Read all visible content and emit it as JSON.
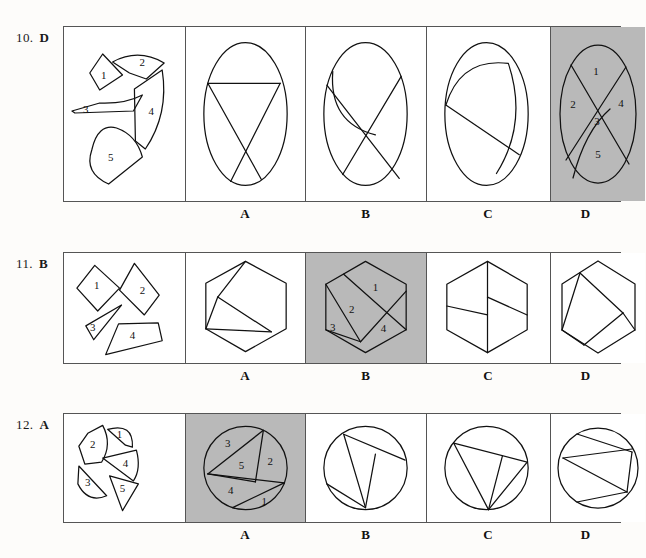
{
  "page": {
    "background": "#fdfcfa",
    "shaded_color": "#b9b9b9",
    "stroke_color": "#111111"
  },
  "rows": [
    {
      "id": "row-10",
      "number": "10.",
      "answer": "D",
      "pieces_panel": {
        "name": "pieces-panel-10",
        "piece_labels": [
          "1",
          "2",
          "3",
          "4",
          "5"
        ]
      },
      "options": [
        {
          "letter": "A",
          "shaded": false
        },
        {
          "letter": "B",
          "shaded": false
        },
        {
          "letter": "C",
          "shaded": false
        },
        {
          "letter": "D",
          "shaded": true,
          "piece_labels": [
            "1",
            "2",
            "3",
            "4",
            "5"
          ]
        }
      ]
    },
    {
      "id": "row-11",
      "number": "11.",
      "answer": "B",
      "pieces_panel": {
        "name": "pieces-panel-11",
        "piece_labels": [
          "1",
          "2",
          "3",
          "4"
        ]
      },
      "options": [
        {
          "letter": "A",
          "shaded": false
        },
        {
          "letter": "B",
          "shaded": true,
          "piece_labels": [
            "1",
            "2",
            "3",
            "4"
          ]
        },
        {
          "letter": "C",
          "shaded": false
        },
        {
          "letter": "D",
          "shaded": false
        }
      ]
    },
    {
      "id": "row-12",
      "number": "12.",
      "answer": "A",
      "pieces_panel": {
        "name": "pieces-panel-12",
        "piece_labels": [
          "1",
          "2",
          "3",
          "4",
          "5"
        ]
      },
      "options": [
        {
          "letter": "A",
          "shaded": true,
          "piece_labels": [
            "1",
            "2",
            "3",
            "4",
            "5"
          ]
        },
        {
          "letter": "B",
          "shaded": false
        },
        {
          "letter": "C",
          "shaded": false
        },
        {
          "letter": "D",
          "shaded": false
        }
      ]
    }
  ]
}
